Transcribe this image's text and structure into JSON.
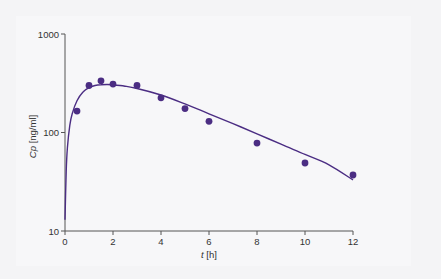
{
  "chart_data": {
    "type": "scatter",
    "title": "",
    "xlabel_italic": "t",
    "xlabel_unit": "[h]",
    "ylabel_italic": "Cp",
    "ylabel_unit": "[ng/ml]",
    "xlim": [
      0,
      12
    ],
    "ylim": [
      10,
      1000
    ],
    "yscale": "log",
    "grid": false,
    "legend": null,
    "x_ticks": [
      0,
      2,
      4,
      6,
      8,
      10,
      12
    ],
    "y_ticks": [
      10,
      100,
      1000
    ],
    "series": [
      {
        "name": "observed",
        "kind": "points",
        "x": [
          0.5,
          1,
          1.5,
          2,
          3,
          4,
          5,
          6,
          8,
          10,
          12
        ],
        "y": [
          165,
          300,
          335,
          310,
          300,
          225,
          175,
          130,
          78,
          49,
          37
        ]
      },
      {
        "name": "fitted",
        "kind": "line",
        "model": "one-compartment oral absorption",
        "x": [
          0,
          0.05,
          0.1,
          0.2,
          0.3,
          0.5,
          0.75,
          1,
          1.25,
          1.5,
          1.75,
          2,
          2.5,
          3,
          4,
          5,
          6,
          7,
          8,
          9,
          10,
          11,
          12
        ],
        "y": [
          13,
          40,
          70,
          118,
          155,
          210,
          258,
          285,
          300,
          306,
          307,
          305,
          295,
          280,
          240,
          195,
          155,
          123,
          97,
          76,
          60,
          47,
          33
        ]
      }
    ],
    "colors": {
      "points": "#4b2d83",
      "line": "#4b2d83",
      "axis": "#555555"
    }
  }
}
